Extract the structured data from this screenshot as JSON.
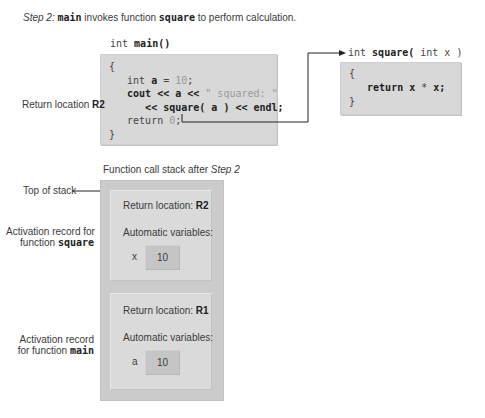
{
  "caption": {
    "step_italic": "Step 2:",
    "main_code": "main",
    "text1": " invokes function ",
    "square_code": "square",
    "text2": " to perform calculation."
  },
  "main_function": {
    "signature_kw": "int ",
    "signature_name": "main()",
    "lines": [
      {
        "parts": [
          {
            "t": "{",
            "c": "n"
          }
        ]
      },
      {
        "parts": [
          {
            "t": "   int ",
            "c": "n"
          },
          {
            "t": "a",
            "c": "b"
          },
          {
            "t": " = ",
            "c": "n"
          },
          {
            "t": "10",
            "c": "g"
          },
          {
            "t": ";",
            "c": "n"
          }
        ]
      },
      {
        "parts": [
          {
            "t": "   cout << a << ",
            "c": "b"
          },
          {
            "t": "\" squared: \"",
            "c": "g"
          }
        ]
      },
      {
        "parts": [
          {
            "t": "      << square( a ) << endl;",
            "c": "b"
          }
        ]
      },
      {
        "parts": [
          {
            "t": "   return ",
            "c": "n"
          },
          {
            "t": "0",
            "c": "g"
          },
          {
            "t": ";",
            "c": "n"
          }
        ]
      },
      {
        "parts": [
          {
            "t": "}",
            "c": "n"
          }
        ]
      }
    ]
  },
  "square_function": {
    "signature_kw": "int ",
    "signature_name": "square(",
    "signature_rest": " int x )",
    "lines": [
      {
        "parts": [
          {
            "t": "{",
            "c": "n"
          }
        ]
      },
      {
        "parts": [
          {
            "t": "   return x ",
            "c": "b"
          },
          {
            "t": "*",
            "c": "n"
          },
          {
            "t": " x;",
            "c": "b"
          }
        ]
      },
      {
        "parts": [
          {
            "t": "}",
            "c": "n"
          }
        ]
      }
    ]
  },
  "return_label": {
    "text": "Return location ",
    "bold": "R2"
  },
  "stack": {
    "title_text": "Function call stack after ",
    "title_italic": "Step 2",
    "top_label": "Top of stack",
    "records": [
      {
        "side_label_line1": "Activation record for",
        "side_label_line2_text": "function ",
        "side_label_line2_code": "square",
        "return_text": "Return location: ",
        "return_value": "R2",
        "vars_label": "Automatic variables:",
        "var_name": "x",
        "var_value": "10"
      },
      {
        "side_label_line1": "Activation record",
        "side_label_line2_text": "for function ",
        "side_label_line2_code": "main",
        "return_text": "Return location: ",
        "return_value": "R1",
        "vars_label": "Automatic variables:",
        "var_name": "a",
        "var_value": "10"
      }
    ]
  },
  "colors": {
    "code_box": "#d8d8d8",
    "stack_outer": "#cbcbcb",
    "stack_inner": "#dadada",
    "value_box": "#c5c5c5",
    "arrow": "#222222"
  }
}
